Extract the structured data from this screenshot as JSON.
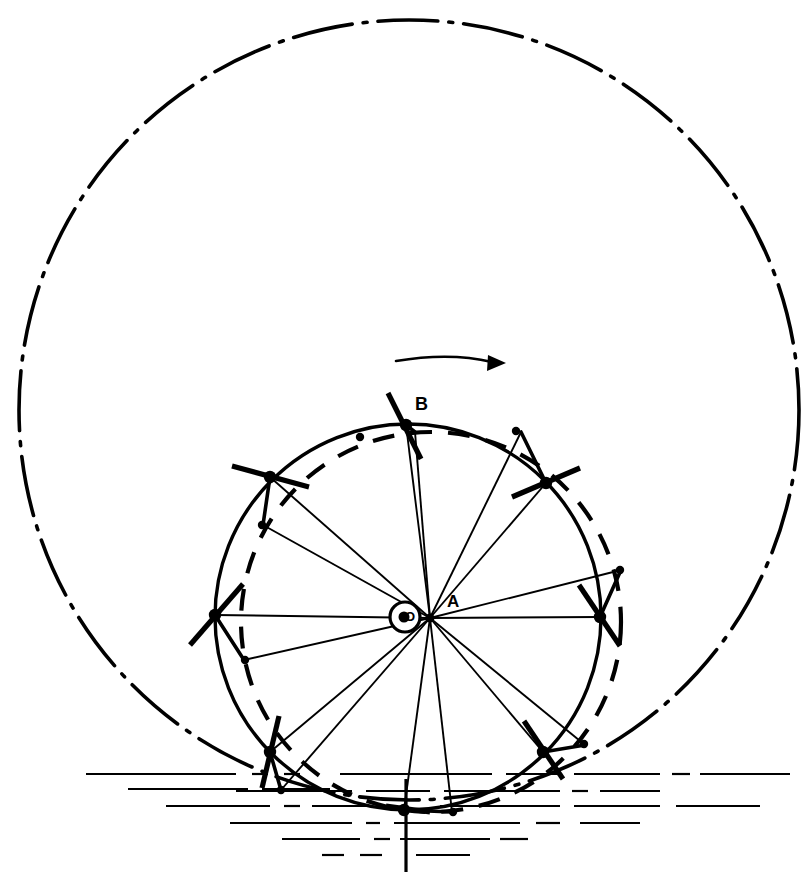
{
  "figure": {
    "domain_kind": "engineering-line-diagram",
    "background_color": "#ffffff",
    "ink_color": "#000000",
    "width": 805,
    "height": 875
  },
  "labels": {
    "hub_center": "O",
    "spoke_center": "A",
    "top_rim_point": "B"
  },
  "label_positions": {
    "hub_center": {
      "x": 405,
      "y": 621
    },
    "spoke_center": {
      "x": 447,
      "y": 607
    },
    "top_rim_point": {
      "x": 415,
      "y": 410
    }
  },
  "rotation_arrow": {
    "name": "rotation-direction-arrow",
    "direction": "clockwise",
    "path": "M 396 361 Q 450 352 492 362",
    "head": "488,355 506,363 487,371"
  },
  "outer_trajectory_circle": {
    "name": "outer-trajectory-circle",
    "style": "dash-dot",
    "cx": 409,
    "cy": 410,
    "r": 390,
    "stroke_width": 3.6,
    "dash_pattern": "60 11 4 11"
  },
  "wheel_rim_circle": {
    "name": "wheel-rim-circle",
    "style": "solid",
    "cx": 408,
    "cy": 617,
    "r": 193,
    "stroke_width": 3.4
  },
  "eccentric_guide_circle": {
    "name": "eccentric-guide-circle",
    "style": "dashed",
    "cx": 431,
    "cy": 622,
    "r": 190,
    "stroke_width": 4.2,
    "dash_pattern": "22 16"
  },
  "hub": {
    "name": "hub",
    "outer_circle": {
      "cx": 405,
      "cy": 617,
      "r": 15,
      "stroke_width": 3.2
    },
    "inner_dot": {
      "cx": 404,
      "cy": 617,
      "r": 5.5
    }
  },
  "spoke_center_point": {
    "x": 430,
    "y": 618,
    "r": 4.5
  },
  "paddles": [
    {
      "id": "paddle-1",
      "label": "B",
      "angle_deg": -92,
      "rim": {
        "x": 406,
        "y": 425
      },
      "blade": {
        "x1": 388,
        "y1": 393,
        "x2": 421,
        "y2": 459
      },
      "pivot": {
        "x": 415,
        "y": 432
      },
      "spoke_to": {
        "x": 430,
        "y": 618
      }
    },
    {
      "id": "paddle-2",
      "angle_deg": -47,
      "rim": {
        "x": 546,
        "y": 483
      },
      "blade": {
        "x1": 512,
        "y1": 497,
        "x2": 580,
        "y2": 468
      },
      "pivot": {
        "x": 521,
        "y": 432
      },
      "spoke_to": {
        "x": 430,
        "y": 618
      }
    },
    {
      "id": "paddle-3",
      "angle_deg": -2,
      "rim": {
        "x": 600,
        "y": 617
      },
      "blade": {
        "x1": 579,
        "y1": 585,
        "x2": 620,
        "y2": 646
      },
      "pivot": {
        "x": 621,
        "y": 570
      },
      "spoke_to": {
        "x": 430,
        "y": 618
      }
    },
    {
      "id": "paddle-4",
      "angle_deg": 43,
      "rim": {
        "x": 543,
        "y": 752
      },
      "blade": {
        "x1": 524,
        "y1": 721,
        "x2": 563,
        "y2": 779
      },
      "pivot": {
        "x": 585,
        "y": 745
      },
      "spoke_to": {
        "x": 430,
        "y": 618
      }
    },
    {
      "id": "paddle-5",
      "angle_deg": 88,
      "rim": {
        "x": 404,
        "y": 810
      },
      "blade": {
        "x1": 386,
        "y1": 806,
        "x2": 430,
        "y2": 812
      },
      "pivot": {
        "x": 452,
        "y": 812
      },
      "spoke_to": {
        "x": 430,
        "y": 618
      }
    },
    {
      "id": "paddle-6",
      "angle_deg": 133,
      "rim": {
        "x": 270,
        "y": 752
      },
      "blade": {
        "x1": 279,
        "y1": 716,
        "x2": 262,
        "y2": 788
      },
      "pivot": {
        "x": 281,
        "y": 790
      },
      "spoke_to": {
        "x": 430,
        "y": 618
      }
    },
    {
      "id": "paddle-7",
      "angle_deg": 178,
      "rim": {
        "x": 215,
        "y": 615
      },
      "blade": {
        "x1": 190,
        "y1": 645,
        "x2": 243,
        "y2": 584
      },
      "pivot": {
        "x": 244,
        "y": 660
      },
      "spoke_to": {
        "x": 430,
        "y": 618
      }
    },
    {
      "id": "paddle-8",
      "angle_deg": -137,
      "rim": {
        "x": 270,
        "y": 477
      },
      "blade": {
        "x1": 232,
        "y1": 466,
        "x2": 309,
        "y2": 487
      },
      "pivot": {
        "x": 263,
        "y": 525
      },
      "spoke_to": {
        "x": 430,
        "y": 618
      }
    }
  ],
  "rim_dots": [
    {
      "x": 406,
      "y": 425
    },
    {
      "x": 546,
      "y": 483
    },
    {
      "x": 600,
      "y": 617
    },
    {
      "x": 543,
      "y": 752
    },
    {
      "x": 404,
      "y": 810
    },
    {
      "x": 270,
      "y": 752
    },
    {
      "x": 215,
      "y": 615
    },
    {
      "x": 270,
      "y": 477
    }
  ],
  "guide_dots": [
    {
      "x": 360,
      "y": 437
    },
    {
      "x": 516,
      "y": 431
    },
    {
      "x": 620,
      "y": 570
    },
    {
      "x": 584,
      "y": 744
    },
    {
      "x": 453,
      "y": 812
    },
    {
      "x": 281,
      "y": 790
    },
    {
      "x": 245,
      "y": 660
    },
    {
      "x": 262,
      "y": 525
    }
  ],
  "water": {
    "name": "water-hatching",
    "center_line": {
      "x": 406,
      "y_top": 779,
      "y_bottom": 872
    },
    "lines": [
      {
        "x1": 86,
        "y": 774,
        "x2": 236
      },
      {
        "x1": 252,
        "y": 774,
        "x2": 268
      },
      {
        "x1": 284,
        "y": 774,
        "x2": 300
      },
      {
        "x1": 340,
        "y": 774,
        "x2": 492
      },
      {
        "x1": 506,
        "y": 774,
        "x2": 560
      },
      {
        "x1": 574,
        "y": 774,
        "x2": 660
      },
      {
        "x1": 672,
        "y": 774,
        "x2": 690
      },
      {
        "x1": 700,
        "y": 774,
        "x2": 790
      },
      {
        "x1": 128,
        "y": 789,
        "x2": 248
      },
      {
        "x1": 262,
        "y": 789,
        "x2": 330
      },
      {
        "x1": 236,
        "y": 791,
        "x2": 352
      },
      {
        "x1": 366,
        "y": 791,
        "x2": 430
      },
      {
        "x1": 444,
        "y": 791,
        "x2": 560
      },
      {
        "x1": 572,
        "y": 791,
        "x2": 588
      },
      {
        "x1": 600,
        "y": 791,
        "x2": 660
      },
      {
        "x1": 166,
        "y": 806,
        "x2": 270
      },
      {
        "x1": 284,
        "y": 806,
        "x2": 300
      },
      {
        "x1": 312,
        "y": 806,
        "x2": 368
      },
      {
        "x1": 440,
        "y": 806,
        "x2": 560
      },
      {
        "x1": 574,
        "y": 806,
        "x2": 660
      },
      {
        "x1": 676,
        "y": 806,
        "x2": 760
      },
      {
        "x1": 230,
        "y": 823,
        "x2": 352
      },
      {
        "x1": 366,
        "y": 823,
        "x2": 380
      },
      {
        "x1": 394,
        "y": 823,
        "x2": 520
      },
      {
        "x1": 536,
        "y": 823,
        "x2": 560
      },
      {
        "x1": 580,
        "y": 823,
        "x2": 640
      },
      {
        "x1": 282,
        "y": 839,
        "x2": 360
      },
      {
        "x1": 374,
        "y": 839,
        "x2": 390
      },
      {
        "x1": 400,
        "y": 839,
        "x2": 490
      },
      {
        "x1": 500,
        "y": 839,
        "x2": 528
      },
      {
        "x1": 322,
        "y": 855,
        "x2": 344
      },
      {
        "x1": 360,
        "y": 855,
        "x2": 382
      },
      {
        "x1": 416,
        "y": 855,
        "x2": 470
      }
    ]
  }
}
